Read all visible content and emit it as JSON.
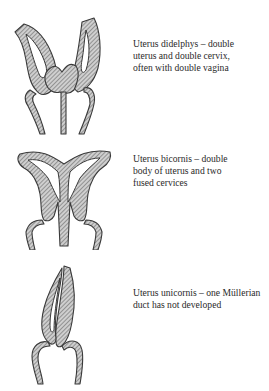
{
  "figures": [
    {
      "id": "didelphys",
      "caption_lines": [
        "Uterus didelphys – double",
        "uterus and double cervix,",
        "often with double vagina"
      ]
    },
    {
      "id": "bicornis",
      "caption_lines": [
        "Uterus bicornis – double",
        "body of uterus and two",
        "fused cervices"
      ]
    },
    {
      "id": "unicornis",
      "caption_lines": [
        "Uterus unicornis – one Müllerian",
        "duct has not developed"
      ]
    }
  ]
}
